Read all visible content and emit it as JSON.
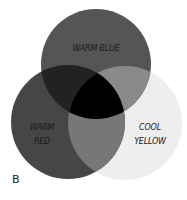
{
  "diagram": {
    "type": "venn",
    "panel_label": "B",
    "circles": [
      {
        "id": "top",
        "label": "WARM BLUE",
        "cx": 96,
        "cy": 64,
        "r": 55,
        "color": "#555555"
      },
      {
        "id": "left",
        "label_line1": "WARM",
        "label_line2": "RED",
        "cx": 68,
        "cy": 122,
        "r": 57,
        "color": "#464646"
      },
      {
        "id": "right",
        "label_line1": "COOL",
        "label_line2": "YELLOW",
        "cx": 125,
        "cy": 123,
        "r": 57,
        "color": "#eeeeee"
      }
    ],
    "overlaps": {
      "top_left": "#222222",
      "top_right": "#8a8a8a",
      "left_right": "#777777",
      "center": "#000000"
    }
  }
}
